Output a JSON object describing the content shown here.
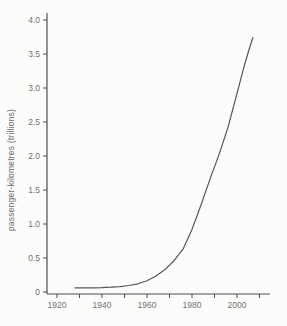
{
  "chart_data": {
    "type": "line",
    "title": "",
    "xlabel": "",
    "ylabel": "passenger-kilometres (trillions)",
    "grid": false,
    "legend": "none",
    "xlim": [
      1915.5,
      2014.5
    ],
    "ylim": [
      0,
      4.1
    ],
    "x_ticks": [
      1920,
      1930,
      1940,
      1950,
      1960,
      1970,
      1980,
      1990,
      2000,
      2010
    ],
    "x_labeled_ticks": [
      1920,
      1940,
      1960,
      1980,
      2000
    ],
    "x_tick_labels": [
      "1920",
      "1940",
      "1960",
      "1980",
      "2000"
    ],
    "y_ticks": [
      0,
      0.5,
      1.0,
      1.5,
      2.0,
      2.5,
      3.0,
      3.5,
      4.0
    ],
    "y_tick_labels": [
      "0",
      "0.5",
      "1.0",
      "1.5",
      "2.0",
      "2.5",
      "3.0",
      "3.5",
      "4.0"
    ],
    "series": [
      {
        "name": "world passenger-kilometres",
        "points": [
          [
            1928,
            0.06
          ],
          [
            1932,
            0.06
          ],
          [
            1936,
            0.062
          ],
          [
            1940,
            0.065
          ],
          [
            1944,
            0.07
          ],
          [
            1948,
            0.08
          ],
          [
            1952,
            0.095
          ],
          [
            1956,
            0.12
          ],
          [
            1960,
            0.165
          ],
          [
            1964,
            0.235
          ],
          [
            1968,
            0.33
          ],
          [
            1972,
            0.46
          ],
          [
            1976,
            0.63
          ],
          [
            1980,
            0.92
          ],
          [
            1984,
            1.28
          ],
          [
            1988,
            1.66
          ],
          [
            1992,
            2.02
          ],
          [
            1996,
            2.42
          ],
          [
            2000,
            2.92
          ],
          [
            2003,
            3.3
          ],
          [
            2005,
            3.53
          ],
          [
            2007,
            3.74
          ]
        ]
      }
    ],
    "colors": {
      "curve": "#565656",
      "axis": "#4d4d4d",
      "tick": "#4d4d4d",
      "tick_label": "#717171",
      "background": "#fcfcfa"
    }
  }
}
